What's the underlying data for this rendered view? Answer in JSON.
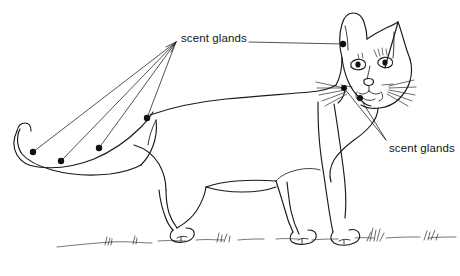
{
  "figure": {
    "view": "side profile, walking, head turned toward viewer",
    "style": "black ink line drawing on white background",
    "background_color": "#ffffff",
    "ink_color": "#1a1a1a",
    "marker_color": "#101010"
  },
  "labels": {
    "tail_label": "scent glands",
    "face_label": "scent glands"
  },
  "annotations": {
    "marker_name": "gland-marker-dot",
    "tail_marker_count": 4,
    "face_marker_count": 3,
    "total_marker_count": 7,
    "tail_leader_origin": {
      "x": 176,
      "y": 42
    },
    "face_leader_origin": {
      "x": 386,
      "y": 140
    },
    "tail_markers": [
      {
        "x": 33,
        "y": 152
      },
      {
        "x": 61,
        "y": 161
      },
      {
        "x": 99,
        "y": 148
      },
      {
        "x": 147,
        "y": 118
      }
    ],
    "face_markers": [
      {
        "x": 343,
        "y": 44
      },
      {
        "x": 344,
        "y": 88
      },
      {
        "x": 360,
        "y": 98
      }
    ]
  }
}
